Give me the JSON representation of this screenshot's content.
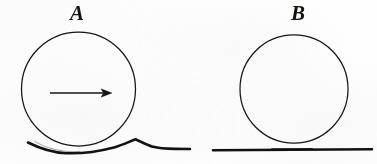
{
  "figure": {
    "type": "line-diagram",
    "background_color": "#fefefe",
    "ink_color": "#181512",
    "width": 377,
    "height": 164,
    "caption": ""
  },
  "panels": [
    {
      "id": "panel-a",
      "label": "A",
      "label_style": "bold-italic-serif",
      "label_x": 78,
      "label_y": 13,
      "circle": {
        "cx": 78.5,
        "cy": 89.0,
        "r": 57.0,
        "stroke_width": 1.25,
        "fill": "none"
      },
      "arrow": {
        "present": true,
        "direction": "right",
        "x1": 50,
        "y1": 93,
        "x2": 112,
        "y2": 93,
        "head_length": 11,
        "head_half_width": 4.2,
        "stroke_width": 1.6,
        "meaning": "direction-of-motion"
      },
      "ground": {
        "deformed": true,
        "x_start": 28,
        "x_end": 190,
        "baseline_y": 150,
        "trough_y": 153,
        "crest_y": 139,
        "crest_x": 135,
        "stroke_width": 2.6,
        "meaning": "deformed-surface-bow-wave"
      }
    },
    {
      "id": "panel-b",
      "label": "B",
      "label_style": "bold-italic-serif",
      "label_x": 299,
      "label_y": 13,
      "circle": {
        "cx": 294.0,
        "cy": 89.0,
        "r": 54.0,
        "stroke_width": 1.25,
        "fill": "none"
      },
      "arrow": {
        "present": false
      },
      "ground": {
        "deformed": false,
        "x_start": 213,
        "x_end": 372,
        "baseline_y": 150,
        "trough_y": 150,
        "crest_y": 150,
        "crest_x": 0,
        "stroke_width": 2.6,
        "meaning": "flat-undeformed-surface"
      }
    }
  ],
  "colors": {
    "ink": "#181512",
    "paper": "#fefefe",
    "line": "#111111"
  }
}
